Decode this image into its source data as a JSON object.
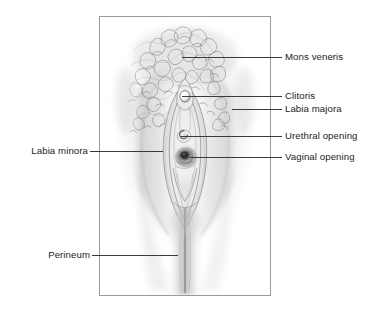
{
  "figure": {
    "kind": "anatomical-illustration",
    "style": "grayscale pencil drawing",
    "background_color": "#ffffff",
    "frame_color": "#9b9b9b",
    "label_color": "#1c1c1c",
    "leader_color": "#3a3a3a"
  },
  "labels": {
    "mons_veneris": "Mons veneris",
    "clitoris": "Clitoris",
    "labia_majora": "Labia majora",
    "urethral_opening": "Urethral opening",
    "vaginal_opening": "Vaginal opening",
    "labia_minora": "Labia minora",
    "perineum": "Perineum"
  },
  "callouts": [
    {
      "id": "mons-veneris",
      "text": "Mons veneris",
      "side": "right",
      "text_x": 285,
      "text_y": 51,
      "line_x1": 182,
      "line_x2": 282,
      "line_y": 57
    },
    {
      "id": "clitoris",
      "text": "Clitoris",
      "side": "right",
      "text_x": 285,
      "text_y": 90,
      "line_x1": 182,
      "line_x2": 282,
      "line_y": 96
    },
    {
      "id": "labia-majora",
      "text": "Labia majora",
      "side": "right",
      "text_x": 285,
      "text_y": 103,
      "line_x1": 232,
      "line_x2": 282,
      "line_y": 109
    },
    {
      "id": "urethral-opening",
      "text": "Urethral opening",
      "side": "right",
      "text_x": 285,
      "text_y": 130,
      "line_x1": 181,
      "line_x2": 282,
      "line_y": 136
    },
    {
      "id": "vaginal-opening",
      "text": "Vaginal opening",
      "side": "right",
      "text_x": 285,
      "text_y": 151,
      "line_x1": 190,
      "line_x2": 282,
      "line_y": 157
    },
    {
      "id": "labia-minora",
      "text": "Labia minora",
      "side": "left",
      "text_x": 22,
      "text_y": 145,
      "line_x1": 90,
      "line_x2": 163,
      "line_y": 151
    },
    {
      "id": "perineum",
      "text": "Perineum",
      "side": "left",
      "text_x": 37,
      "text_y": 249,
      "line_x1": 92,
      "line_x2": 178,
      "line_y": 255
    }
  ]
}
